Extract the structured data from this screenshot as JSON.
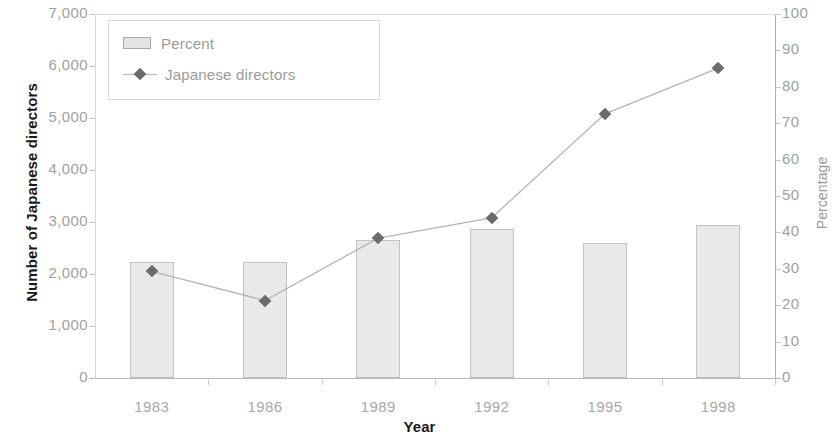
{
  "chart_data": {
    "type": "bar",
    "title": "",
    "xlabel": "Year",
    "ylabel": "Number of Japanese directors",
    "y2label": "Percentage",
    "categories": [
      "1983",
      "1986",
      "1989",
      "1992",
      "1995",
      "1998"
    ],
    "ylim": [
      0,
      7000
    ],
    "y2lim": [
      0,
      100
    ],
    "yticks": [
      "0",
      "1,000",
      "2,000",
      "3,000",
      "4,000",
      "5,000",
      "6,000",
      "7,000"
    ],
    "ytick_values": [
      0,
      1000,
      2000,
      3000,
      4000,
      5000,
      6000,
      7000
    ],
    "y2ticks": [
      "0",
      "10",
      "20",
      "30",
      "40",
      "50",
      "60",
      "70",
      "80",
      "90",
      "100"
    ],
    "y2tick_values": [
      0,
      10,
      20,
      30,
      40,
      50,
      60,
      70,
      80,
      90,
      100
    ],
    "grid": false,
    "legend_position": "top-left",
    "series": [
      {
        "name": "Percent",
        "type": "bar",
        "axis": "right",
        "values": [
          32,
          32,
          38,
          41,
          37,
          42
        ],
        "color": "#e9e9e9",
        "edge_color": "#c2c2c2"
      },
      {
        "name": "Japanese directors",
        "type": "line",
        "axis": "left",
        "values": [
          2050,
          1490,
          2690,
          3080,
          5080,
          5960
        ],
        "color": "#b4b4b4",
        "marker_color": "#6b6b6b",
        "marker": "diamond"
      }
    ]
  },
  "legend": {
    "items": [
      {
        "label": "Percent",
        "marker": "bar-swatch"
      },
      {
        "label": "Japanese directors",
        "marker": "diamond-line"
      }
    ]
  },
  "axes": {
    "left_title": "Number of Japanese directors",
    "right_title": "Percentage",
    "bottom_title": "Year"
  }
}
